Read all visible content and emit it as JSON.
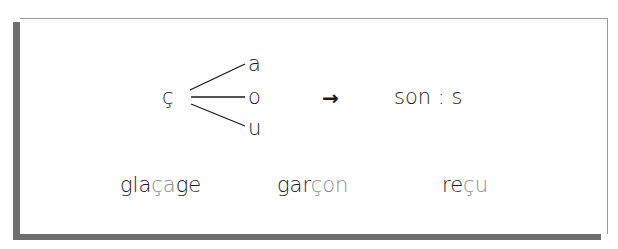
{
  "rule": {
    "letter": "ç",
    "vowels": [
      "a",
      "o",
      "u"
    ],
    "arrow": "→",
    "sound_label": "son : s"
  },
  "examples": [
    {
      "word": "glaçage",
      "parts": [
        "gla",
        "ça",
        "ge"
      ]
    },
    {
      "word": "garçon",
      "parts": [
        "gar",
        "çon",
        ""
      ]
    },
    {
      "word": "reçu",
      "parts": [
        "re",
        "çu",
        ""
      ]
    }
  ],
  "colors": {
    "text": "#1a1a1a",
    "highlight": "#8c8c8c",
    "shadow": "#6e6e6e",
    "border": "#9a9a9a"
  }
}
